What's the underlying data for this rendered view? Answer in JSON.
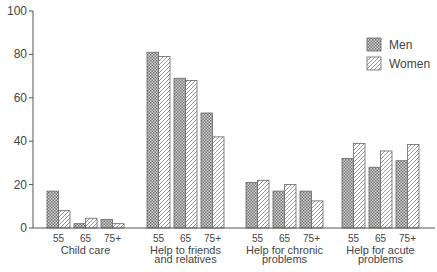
{
  "chart_data": {
    "type": "bar",
    "title": "",
    "xlabel": "",
    "ylabel": "",
    "ylim": [
      0,
      100
    ],
    "yticks": [
      0,
      20,
      40,
      60,
      80,
      100
    ],
    "grid": false,
    "legend_position": "upper-right",
    "groups": [
      {
        "label_lines": [
          "Child care"
        ],
        "subcategories": [
          "55",
          "65",
          "75+"
        ]
      },
      {
        "label_lines": [
          "Help to friends",
          "and relatives"
        ],
        "subcategories": [
          "55",
          "65",
          "75+"
        ]
      },
      {
        "label_lines": [
          "Help for chronic",
          "problems"
        ],
        "subcategories": [
          "55",
          "65",
          "75+"
        ]
      },
      {
        "label_lines": [
          "Help for acute",
          "problems"
        ],
        "subcategories": [
          "55",
          "65",
          "75+"
        ]
      }
    ],
    "categories": [
      "Child care 55",
      "Child care 65",
      "Child care 75+",
      "Help to friends and relatives 55",
      "Help to friends and relatives 65",
      "Help to friends and relatives 75+",
      "Help for chronic problems 55",
      "Help for chronic problems 65",
      "Help for chronic problems 75+",
      "Help for acute problems 55",
      "Help for acute problems 65",
      "Help for acute problems 75+"
    ],
    "series": [
      {
        "name": "Men",
        "pattern": "crosshatch",
        "values": [
          17,
          2,
          4,
          81,
          69,
          53,
          21,
          17,
          17,
          32,
          28,
          31
        ]
      },
      {
        "name": "Women",
        "pattern": "diagonal",
        "values": [
          8,
          4.5,
          2,
          79,
          68,
          42,
          22,
          20,
          12.5,
          39,
          35.5,
          38.5
        ]
      }
    ]
  },
  "legend": {
    "items": [
      {
        "label": "Men",
        "pattern": "crosshatch"
      },
      {
        "label": "Women",
        "pattern": "diagonal"
      }
    ]
  },
  "colors": {
    "axis": "#555555",
    "bar_outline": "#666666",
    "crosshatch": "#777777",
    "diagonal": "#888888",
    "text": "#444444"
  }
}
